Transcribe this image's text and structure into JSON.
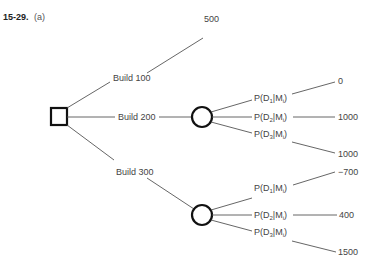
{
  "problem": {
    "number": "15-29.",
    "part": "(a)"
  },
  "decision_node": {
    "shape": "square"
  },
  "branches": [
    {
      "label": "Build 100",
      "payoff": "500"
    },
    {
      "label": "Build 200",
      "chance_outcomes": [
        {
          "label_prefix": "P(D",
          "sub_d": "1",
          "mid": "|M",
          "sub_m": "i",
          "suffix": ")",
          "payoff": "0"
        },
        {
          "label_prefix": "P(D",
          "sub_d": "2",
          "mid": "|M",
          "sub_m": "i",
          "suffix": ")",
          "payoff": "1000"
        },
        {
          "label_prefix": "P(D",
          "sub_d": "3",
          "mid": "|M",
          "sub_m": "i",
          "suffix": ")",
          "payoff": "1000"
        }
      ]
    },
    {
      "label": "Build 300",
      "chance_outcomes": [
        {
          "label_prefix": "P(D",
          "sub_d": "1",
          "mid": "|M",
          "sub_m": "i",
          "suffix": ")",
          "payoff": "−700"
        },
        {
          "label_prefix": "P(D",
          "sub_d": "2",
          "mid": "|M",
          "sub_m": "i",
          "suffix": ")",
          "payoff": "400"
        },
        {
          "label_prefix": "P(D",
          "sub_d": "3",
          "mid": "|M",
          "sub_m": "i",
          "suffix": ")",
          "payoff": "1500"
        }
      ]
    }
  ]
}
